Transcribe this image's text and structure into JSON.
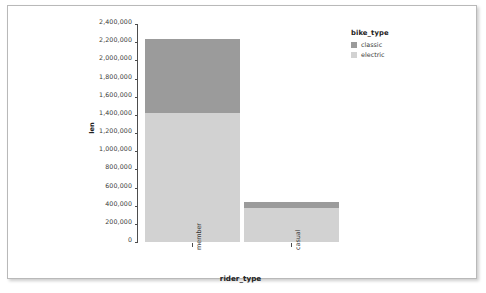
{
  "chart_data": {
    "type": "bar",
    "subtype": "stacked-bar",
    "title": "",
    "xlabel": "rider_type",
    "ylabel": "len",
    "categories": [
      "member",
      "casual"
    ],
    "series": [
      {
        "name": "electric",
        "values": [
          1420000,
          370000
        ],
        "color": "#d2d2d2"
      },
      {
        "name": "classic",
        "values": [
          810000,
          75000
        ],
        "color": "#9b9b9b"
      }
    ],
    "totals": [
      2230000,
      445000
    ],
    "ylim": [
      0,
      2400000
    ],
    "ytick_values": [
      0,
      200000,
      400000,
      600000,
      800000,
      1000000,
      1200000,
      1400000,
      1600000,
      1800000,
      2000000,
      2200000,
      2400000
    ],
    "ytick_labels": [
      "0",
      "200,000",
      "400,000",
      "600,000",
      "800,000",
      "1,000,000",
      "1,200,000",
      "1,400,000",
      "1,600,000",
      "1,800,000",
      "2,000,000",
      "2,200,000",
      "2,400,000"
    ],
    "grid": false,
    "legend_position": "right",
    "stack_order_bottom_to_top": [
      "electric",
      "classic"
    ]
  },
  "axes": {
    "y_title": "len",
    "x_title": "rider_type",
    "y_ticks": [
      {
        "label": "2,400,000",
        "value": 2400000
      },
      {
        "label": "2,200,000",
        "value": 2200000
      },
      {
        "label": "2,000,000",
        "value": 2000000
      },
      {
        "label": "1,800,000",
        "value": 1800000
      },
      {
        "label": "1,600,000",
        "value": 1600000
      },
      {
        "label": "1,400,000",
        "value": 1400000
      },
      {
        "label": "1,200,000",
        "value": 1200000
      },
      {
        "label": "1,000,000",
        "value": 1000000
      },
      {
        "label": "800,000",
        "value": 800000
      },
      {
        "label": "600,000",
        "value": 600000
      },
      {
        "label": "400,000",
        "value": 400000
      },
      {
        "label": "200,000",
        "value": 200000
      },
      {
        "label": "0",
        "value": 0
      }
    ],
    "x_ticks": [
      {
        "label": "member"
      },
      {
        "label": "casual"
      }
    ]
  },
  "legend": {
    "title": "bike_type",
    "items": [
      {
        "label": "classic",
        "color": "#9b9b9b"
      },
      {
        "label": "electric",
        "color": "#d2d2d2"
      }
    ]
  },
  "colors": {
    "classic": "#9b9b9b",
    "electric": "#d2d2d2",
    "axis": "#4d4d4d",
    "text": "#3a3a3a",
    "frame": "#b9b9b9",
    "background": "#ffffff"
  }
}
